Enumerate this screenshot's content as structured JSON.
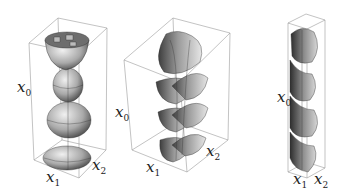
{
  "figure": {
    "panels": [
      {
        "id": "panel-1",
        "description": "Stacked spheroids of revolution (vertical chain of bulbs)",
        "axes": {
          "x_label": "x",
          "x_sub": "1",
          "y_label": "x",
          "y_sub": "2",
          "z_label": "x",
          "z_sub": "0"
        }
      },
      {
        "id": "panel-2",
        "description": "Helical twisted surface (spiral of lobes)",
        "axes": {
          "x_label": "x",
          "x_sub": "1",
          "y_label": "x",
          "y_sub": "2",
          "z_label": "x",
          "z_sub": "0"
        }
      },
      {
        "id": "panel-3",
        "description": "Narrow twisted helical surface in tall box",
        "axes": {
          "x_label": "x",
          "x_sub": "1",
          "y_label": "x",
          "y_sub": "2",
          "z_label": "x",
          "z_sub": "0"
        }
      }
    ],
    "colors": {
      "surface_light": "#d9d9d9",
      "surface_mid": "#a8a8a8",
      "surface_dark": "#555555",
      "box_line": "#9a9a9a",
      "mesh": "#333333"
    }
  }
}
